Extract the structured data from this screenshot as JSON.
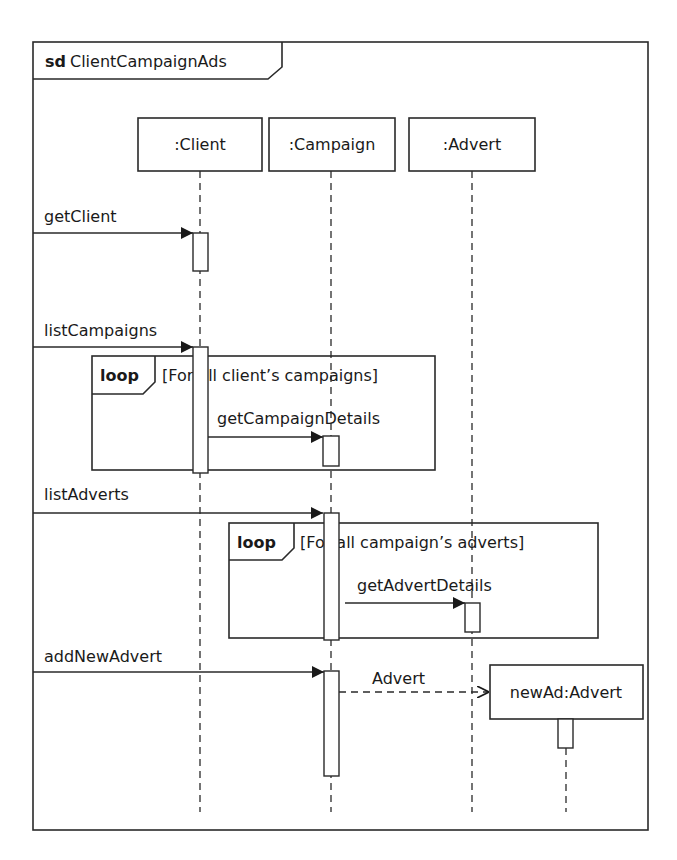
{
  "diagram": {
    "type": "UML sequence diagram",
    "frame": {
      "keyword": "sd",
      "name": "ClientCampaignAds"
    },
    "lifelines": [
      {
        "id": "client",
        "label": ":Client"
      },
      {
        "id": "campaign",
        "label": ":Campaign"
      },
      {
        "id": "advert",
        "label": ":Advert"
      },
      {
        "id": "newad",
        "label": "newAd:Advert",
        "created": true
      }
    ],
    "messages": [
      {
        "label": "getClient",
        "from": "gate",
        "to": "client",
        "kind": "synchronous"
      },
      {
        "label": "listCampaigns",
        "from": "gate",
        "to": "client",
        "kind": "synchronous"
      },
      {
        "label": "getCampaignDetails",
        "from": "client",
        "to": "campaign",
        "kind": "synchronous"
      },
      {
        "label": "listAdverts",
        "from": "gate",
        "to": "campaign",
        "kind": "synchronous"
      },
      {
        "label": "getAdvertDetails",
        "from": "campaign",
        "to": "advert",
        "kind": "synchronous"
      },
      {
        "label": "addNewAdvert",
        "from": "gate",
        "to": "campaign",
        "kind": "synchronous"
      },
      {
        "label": "Advert",
        "from": "campaign",
        "to": "newad",
        "kind": "create"
      }
    ],
    "fragments": [
      {
        "operator": "loop",
        "guard": "[For all client’s campaigns]"
      },
      {
        "operator": "loop",
        "guard": "[For all campaign’s adverts]"
      }
    ]
  }
}
